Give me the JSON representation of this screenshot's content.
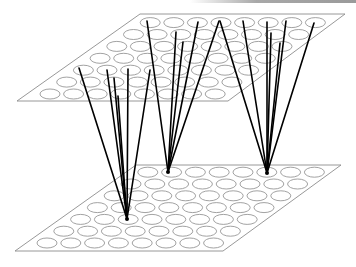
{
  "diagram": {
    "colors": {
      "background": "#ffffff",
      "plane_outline": "#8c8c8c",
      "node_outline": "#8a8a8a",
      "connection": "#000000",
      "top_bar": "#a0a0a0"
    },
    "planes": [
      {
        "id": "upper-plane",
        "corners": [
          [
            140,
            14
          ],
          [
            345,
            14
          ],
          [
            228,
            101
          ],
          [
            17,
            101
          ]
        ],
        "grid": {
          "cols": 8,
          "rows": 7,
          "origin_bottom_left": [
            50,
            94
          ],
          "col_step": [
            23.6,
            0
          ],
          "row_step": [
            16.7,
            -11.9
          ],
          "node_rx": 10,
          "node_ry": 5
        }
      },
      {
        "id": "lower-plane",
        "corners": [
          [
            136,
            165
          ],
          [
            341,
            165
          ],
          [
            223,
            251
          ],
          [
            15,
            251
          ]
        ],
        "grid": {
          "cols": 8,
          "rows": 7,
          "origin_bottom_left": [
            47,
            243
          ],
          "col_step": [
            23.8,
            0
          ],
          "row_step": [
            16.8,
            -11.8
          ],
          "node_rx": 10,
          "node_ry": 5
        }
      }
    ],
    "connection_groups": [
      {
        "id": "group-left",
        "target": [
          127,
          219
        ],
        "sources": [
          [
            79,
            68
          ],
          [
            107,
            70
          ],
          [
            114,
            78
          ],
          [
            118,
            96
          ],
          [
            128,
            69
          ],
          [
            150,
            70
          ]
        ]
      },
      {
        "id": "group-middle",
        "target": [
          168,
          172
        ],
        "sources": [
          [
            147,
            21
          ],
          [
            176,
            32
          ],
          [
            183,
            42
          ],
          [
            198,
            22
          ],
          [
            219,
            21
          ]
        ]
      },
      {
        "id": "group-right",
        "target": [
          267,
          173
        ],
        "sources": [
          [
            220,
            21
          ],
          [
            243,
            21
          ],
          [
            267,
            22
          ],
          [
            271,
            33
          ],
          [
            280,
            43
          ],
          [
            286,
            21
          ],
          [
            314,
            23
          ]
        ]
      }
    ]
  }
}
